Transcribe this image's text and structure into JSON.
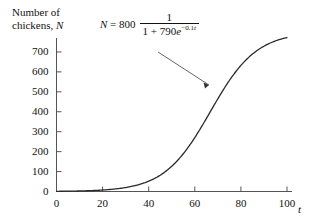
{
  "chart_data": {
    "type": "line",
    "title": "",
    "equation_text": "N = 800 · 1/(1 + 790e^(-0.1t))",
    "equation": {
      "lhs": "N",
      "equals": "=",
      "coefficient": "800",
      "numerator": "1",
      "denominator_prefix": "1 + 790",
      "denominator_base": "e",
      "denominator_exponent": "-0.1t",
      "exponent_sign": "−",
      "exponent_value": "0.1",
      "exponent_variable": "t"
    },
    "ylabel": "Number of chickens, N",
    "ylabel_line1": "Number of",
    "ylabel_line2": "chickens,",
    "ylabel_symbol": "N",
    "xlabel": "t",
    "xlim": [
      0,
      100
    ],
    "ylim": [
      0,
      770
    ],
    "yticks": [
      0,
      100,
      200,
      300,
      400,
      500,
      600,
      700
    ],
    "ytick_labels": [
      "0",
      "100",
      "200",
      "300",
      "400",
      "500",
      "600",
      "700"
    ],
    "xticks": [
      0,
      20,
      40,
      60,
      80,
      100
    ],
    "xtick_labels": [
      "0",
      "20",
      "40",
      "60",
      "80",
      "100"
    ],
    "origin_label": "0",
    "grid": false,
    "legend": "none",
    "carrying_capacity": 800,
    "growth_rate": 0.1,
    "initial_constant": 790,
    "x": [
      0,
      5,
      10,
      15,
      20,
      25,
      30,
      35,
      40,
      45,
      50,
      55,
      60,
      65,
      70,
      75,
      80,
      85,
      90,
      95,
      100
    ],
    "values": [
      1.0,
      1.7,
      2.7,
      4.5,
      7.3,
      12.0,
      19.5,
      31.5,
      50.4,
      79.4,
      122.2,
      182.3,
      261.1,
      355.6,
      456.7,
      552.5,
      633.3,
      695.0,
      738.5,
      767.5,
      786.1
    ],
    "annotation": {
      "text": "arrow from equation to curve",
      "from_x": 57,
      "from_y": 420,
      "to_x": 67,
      "to_y": 400
    },
    "colors": {
      "curve": "#2b2b2b",
      "axis": "#555555",
      "text": "#111111",
      "background": "#ffffff"
    }
  }
}
